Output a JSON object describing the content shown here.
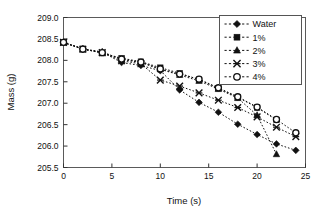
{
  "chart_data": {
    "type": "scatter",
    "title": "",
    "xlabel": "Time (s)",
    "ylabel": "Mass (g)",
    "xlim": [
      0,
      25
    ],
    "ylim": [
      205.5,
      209.0
    ],
    "xticks": [
      0,
      5,
      10,
      15,
      20,
      25
    ],
    "yticks": [
      205.5,
      206.0,
      206.5,
      207.0,
      207.5,
      208.0,
      208.5,
      209.0
    ],
    "xtick_labels": [
      "0",
      "5",
      "10",
      "15",
      "20",
      "25"
    ],
    "ytick_labels": [
      "205.5",
      "206.0",
      "206.5",
      "207.0",
      "207.5",
      "208.0",
      "208.5",
      "209.0"
    ],
    "grid": false,
    "legend_position": "top-right",
    "line_style": "dotted",
    "line_color": "#111111",
    "marker_color": "#111111",
    "x": [
      0,
      2,
      4,
      6,
      8,
      10,
      12,
      14,
      16,
      18,
      20,
      22,
      24
    ],
    "series": [
      {
        "name": "Water",
        "marker": "filled-diamond",
        "values": [
          208.42,
          208.27,
          208.19,
          207.95,
          207.88,
          207.76,
          207.31,
          207.02,
          206.79,
          206.51,
          206.27,
          206.05,
          205.9
        ]
      },
      {
        "name": "1%",
        "marker": "filled-square",
        "values": [
          208.42,
          208.27,
          208.17,
          208.05,
          207.97,
          207.83,
          207.7,
          207.55,
          207.35,
          207.14,
          206.9,
          206.61,
          null
        ]
      },
      {
        "name": "2%",
        "marker": "filled-triangle",
        "values": [
          208.42,
          208.26,
          208.2,
          208.02,
          207.95,
          207.79,
          207.66,
          207.52,
          207.33,
          207.12,
          206.72,
          205.81,
          null
        ]
      },
      {
        "name": "3%",
        "marker": "cross-x",
        "values": [
          208.42,
          208.26,
          208.18,
          207.99,
          207.92,
          207.54,
          207.4,
          207.24,
          207.07,
          206.9,
          206.68,
          206.44,
          206.22
        ]
      },
      {
        "name": "4%",
        "marker": "open-circle",
        "values": [
          208.42,
          208.26,
          208.18,
          208.03,
          207.96,
          207.8,
          207.68,
          207.56,
          207.36,
          207.15,
          206.91,
          206.62,
          206.31
        ]
      }
    ]
  },
  "legend": {
    "entries": [
      {
        "label": "Water",
        "marker": "filled-diamond"
      },
      {
        "label": "1%",
        "marker": "filled-square"
      },
      {
        "label": "2%",
        "marker": "filled-triangle"
      },
      {
        "label": "3%",
        "marker": "cross-x"
      },
      {
        "label": "4%",
        "marker": "open-circle"
      }
    ]
  },
  "axes": {
    "x_title": "Time (s)",
    "y_title": "Mass (g)"
  }
}
